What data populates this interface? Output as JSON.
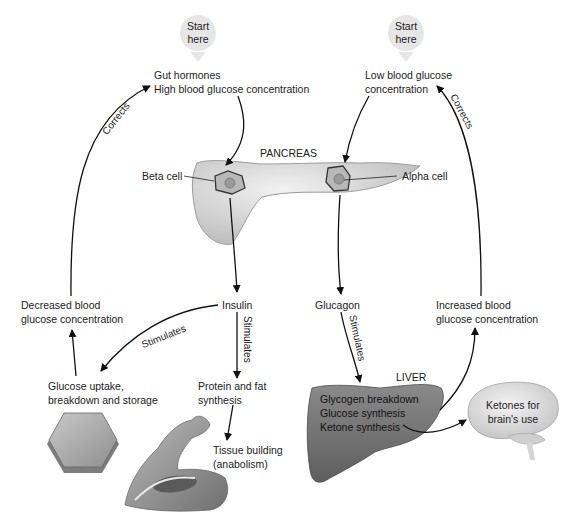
{
  "start_left": {
    "line1": "Start",
    "line2": "here"
  },
  "start_right": {
    "line1": "Start",
    "line2": "here"
  },
  "top_left": {
    "line1": "Gut hormones",
    "line2": "High blood glucose concentration"
  },
  "top_right": {
    "line1": "Low blood glucose",
    "line2": "concentration"
  },
  "pancreas": {
    "title": "PANCREAS",
    "beta": "Beta cell",
    "alpha": "Alpha cell"
  },
  "corrects_left": "Corrects",
  "corrects_right": "Corrects",
  "insulin": "Insulin",
  "glucagon": "Glucagon",
  "stimulates_1": "Stimulates",
  "stimulates_2": "Stimulates",
  "stimulates_3": "Stimulates",
  "decreased": {
    "line1": "Decreased blood",
    "line2": "glucose concentration"
  },
  "increased": {
    "line1": "Increased blood",
    "line2": "glucose concentration"
  },
  "uptake": {
    "line1": "Glucose uptake,",
    "line2": "breakdown and storage"
  },
  "protein": {
    "line1": "Protein and fat",
    "line2": "synthesis"
  },
  "tissue": {
    "line1": "Tissue building",
    "line2": "(anabolism)"
  },
  "liver": {
    "title": "LIVER",
    "items": [
      "Glycogen breakdown",
      "Glucose synthesis",
      "Ketone synthesis"
    ]
  },
  "brain": {
    "line1": "Ketones for",
    "line2": "brain's use"
  }
}
